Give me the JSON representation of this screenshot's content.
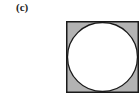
{
  "figure": {
    "label": "(c)",
    "shape": {
      "outer": "square",
      "inner": "circle inscribed in square",
      "square_fill": "#b3b3b3",
      "circle_fill": "#ffffff",
      "stroke": "#1a1a1a"
    }
  }
}
